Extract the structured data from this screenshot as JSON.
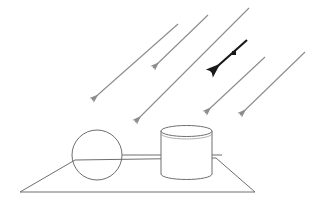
{
  "canvas": {
    "width": 322,
    "height": 204,
    "background": "#ffffff",
    "title": "Incident light rays on a scene with a sphere and a cylinder on a ground plane"
  },
  "style": {
    "ray_color": "#8c8c8c",
    "highlight_ray_color": "#1a1a1a",
    "object_stroke": "#6e6e6e",
    "ground_stroke": "#6e6e6e",
    "ray_stroke_width": 1.1,
    "highlight_stroke_width": 2.2,
    "object_stroke_width": 1,
    "object_fill": "none"
  },
  "ground": {
    "name": "ground-plane",
    "shape": "trapezoid",
    "points": "20,192 75,160 216,158 255,192",
    "vertices": [
      {
        "label": "bottom-left",
        "x": 20,
        "y": 192
      },
      {
        "label": "top-left",
        "x": 75,
        "y": 160
      },
      {
        "label": "top-right",
        "x": 216,
        "y": 158
      },
      {
        "label": "bottom-right",
        "x": 255,
        "y": 192
      }
    ]
  },
  "objects": [
    {
      "name": "sphere",
      "type": "circle",
      "cx": 97,
      "cy": 155,
      "r": 25
    },
    {
      "name": "cylinder",
      "type": "cylinder",
      "left": 161,
      "right": 212,
      "top": 131,
      "bottom": 174,
      "ellipse_ry": 5.5
    },
    {
      "name": "connector-rod",
      "type": "line",
      "x1": 122,
      "y1": 155,
      "x2": 161,
      "y2": 155
    }
  ],
  "rays": [
    {
      "name": "ray-1",
      "tail_x": 178,
      "tail_y": 24,
      "head_x": 92,
      "head_y": 100,
      "highlight": false
    },
    {
      "name": "ray-2",
      "tail_x": 208,
      "tail_y": 15,
      "head_x": 153,
      "head_y": 68,
      "highlight": false
    },
    {
      "name": "ray-3",
      "tail_x": 249,
      "tail_y": 8,
      "head_x": 135,
      "head_y": 122,
      "highlight": false
    },
    {
      "name": "ray-4",
      "tail_x": 265,
      "tail_y": 57,
      "head_x": 205,
      "head_y": 113,
      "highlight": false
    },
    {
      "name": "ray-5",
      "tail_x": 305,
      "tail_y": 52,
      "head_x": 240,
      "head_y": 115,
      "highlight": false
    }
  ],
  "highlight_ray": {
    "name": "highlighted-ray",
    "tail_x": 247,
    "tail_y": 40,
    "head_x": 211,
    "head_y": 72,
    "marker_x": 234,
    "marker_y": 53,
    "marker_size": 4
  }
}
